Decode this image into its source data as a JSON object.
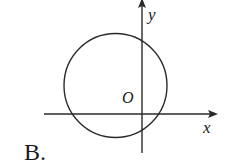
{
  "figure": {
    "option_label": "B.",
    "axes": {
      "x_label": "x",
      "y_label": "y",
      "origin_label": "O"
    },
    "circle": {
      "description": "circle whose center lies in the second quadrant; it intersects the positive and negative x-axis and the positive and negative y-axis",
      "center_quadrant": "II"
    },
    "colors": {
      "stroke": "#2a2a2a",
      "background": "#ffffff"
    }
  }
}
